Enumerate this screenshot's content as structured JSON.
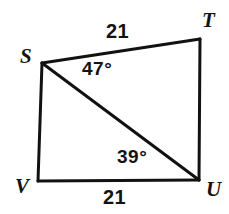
{
  "figure": {
    "name": "Quadrilateral STUV with diagonal SU",
    "shape_type": "quadrilateral",
    "stroke_color": "#111111",
    "background_color": "#ffffff",
    "text_color": "#131313",
    "vertices": [
      {
        "id": "S",
        "label": "S",
        "x": 42,
        "y": 63
      },
      {
        "id": "T",
        "label": "T",
        "x": 200,
        "y": 39
      },
      {
        "id": "U",
        "label": "U",
        "x": 199,
        "y": 180
      },
      {
        "id": "V",
        "label": "V",
        "x": 38,
        "y": 181
      }
    ],
    "edges": [
      {
        "id": "ST",
        "from": "S",
        "to": "T"
      },
      {
        "id": "TU",
        "from": "T",
        "to": "U"
      },
      {
        "id": "UV",
        "from": "U",
        "to": "V"
      },
      {
        "id": "VS",
        "from": "V",
        "to": "S"
      },
      {
        "id": "SU",
        "from": "S",
        "to": "U",
        "role": "diagonal"
      }
    ],
    "side_labels": [
      {
        "id": "ST",
        "text": "21",
        "edge": "ST"
      },
      {
        "id": "VU",
        "text": "21",
        "edge": "UV"
      }
    ],
    "angle_labels": [
      {
        "id": "TSU",
        "text": "47°",
        "value": 47,
        "at_vertex": "S"
      },
      {
        "id": "SUV",
        "text": "39°",
        "value": 39,
        "at_vertex": "U"
      }
    ]
  }
}
